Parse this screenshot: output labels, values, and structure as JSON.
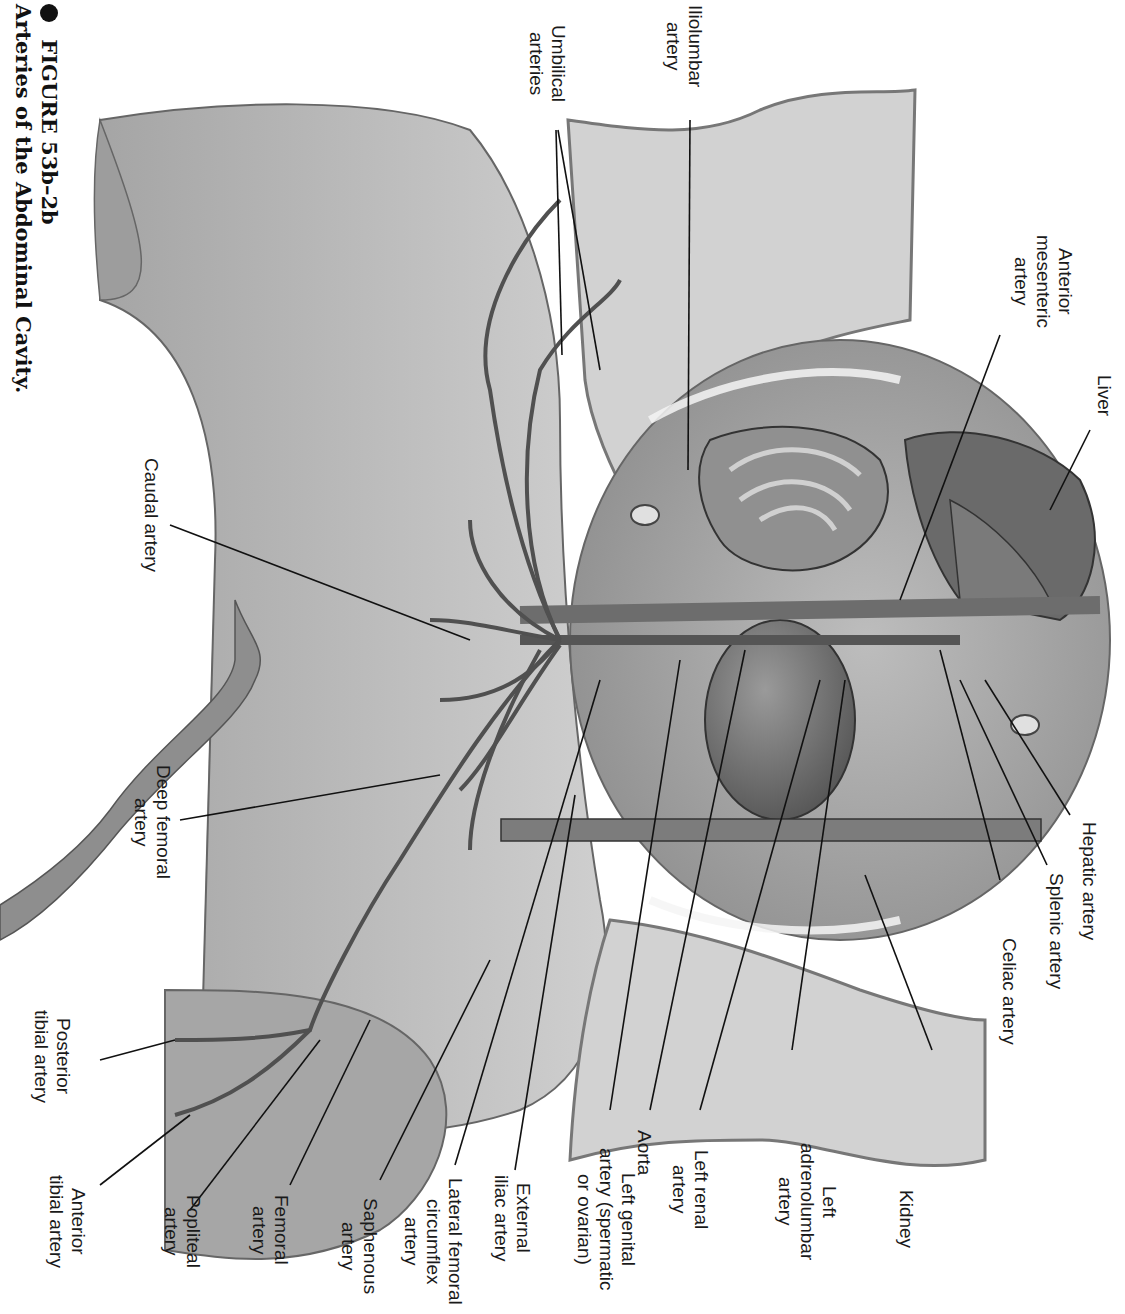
{
  "figure": {
    "number": "FIGURE 53b–2b",
    "title": "Arteries of the Abdominal Cavity.",
    "orientation": "rotated 90° clockwise"
  },
  "labels": [
    {
      "id": "iliolumbar-artery",
      "text": "Iliolumbar\nartery"
    },
    {
      "id": "umbilical-arteries",
      "text": "Umbilical\narteries"
    },
    {
      "id": "anterior-mesenteric-artery",
      "text": "Anterior\nmesenteric\nartery"
    },
    {
      "id": "liver",
      "text": "Liver"
    },
    {
      "id": "hepatic-artery",
      "text": "Hepatic artery"
    },
    {
      "id": "splenic-artery",
      "text": "Splenic artery"
    },
    {
      "id": "celiac-artery",
      "text": "Celiac artery"
    },
    {
      "id": "kidney",
      "text": "Kidney"
    },
    {
      "id": "left-adrenolumbar-artery",
      "text": "Left\nadrenolumbar\nartery"
    },
    {
      "id": "left-renal-artery",
      "text": "Left renal\nartery"
    },
    {
      "id": "aorta",
      "text": "Aorta"
    },
    {
      "id": "left-genital-artery",
      "text": "Left genital\nartery (spermatic\nor ovarian)"
    },
    {
      "id": "external-iliac-artery",
      "text": "External\niliac artery"
    },
    {
      "id": "lateral-femoral-circumflex-artery",
      "text": "Lateral femoral\ncircumflex\nartery"
    },
    {
      "id": "saphenous-artery",
      "text": "Saphenous\nartery"
    },
    {
      "id": "femoral-artery",
      "text": "Femoral\nartery"
    },
    {
      "id": "popliteal-artery",
      "text": "Popliteal\nartery"
    },
    {
      "id": "anterior-tibial-artery",
      "text": "Anterior\ntibial artery"
    },
    {
      "id": "posterior-tibial-artery",
      "text": "Posterior\ntibial artery"
    },
    {
      "id": "deep-femoral-artery",
      "text": "Deep femoral\nartery"
    },
    {
      "id": "caudal-artery",
      "text": "Caudal artery"
    }
  ],
  "colors": {
    "tissue_light": "#d6d6d6",
    "tissue_mid": "#a8a8a8",
    "organ_dark": "#6e6e6e",
    "vessel": "#5a5a5a",
    "line": "#111111"
  }
}
